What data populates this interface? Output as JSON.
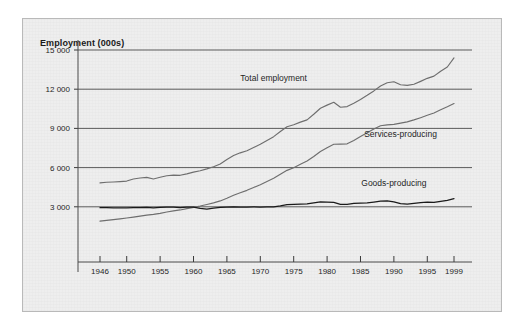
{
  "figure": {
    "title": "Employment (000s)",
    "background_color": "#eeeeee",
    "border_color": "#b9b9b9"
  },
  "chart_data": {
    "type": "line",
    "title": "Employment (000s)",
    "xlabel": "",
    "ylabel": "Employment (000s)",
    "grid": true,
    "legend_position": "inline-annotations",
    "xlim": [
      1946,
      1999
    ],
    "ylim": [
      0,
      15000
    ],
    "x_tick_labels": [
      "1946",
      "1950",
      "1955",
      "1960",
      "1965",
      "1970",
      "1975",
      "1980",
      "1985",
      "1990",
      "1995",
      "1999"
    ],
    "x_ticks": [
      1946,
      1950,
      1955,
      1960,
      1965,
      1970,
      1975,
      1980,
      1985,
      1990,
      1995,
      1999
    ],
    "y_tick_labels": [
      "3 000",
      "6 000",
      "9 000",
      "12 000",
      "15 000"
    ],
    "y_ticks": [
      3000,
      6000,
      9000,
      12000,
      15000
    ],
    "x": [
      1946,
      1947,
      1948,
      1949,
      1950,
      1951,
      1952,
      1953,
      1954,
      1955,
      1956,
      1957,
      1958,
      1959,
      1960,
      1961,
      1962,
      1963,
      1964,
      1965,
      1966,
      1967,
      1968,
      1969,
      1970,
      1971,
      1972,
      1973,
      1974,
      1975,
      1976,
      1977,
      1978,
      1979,
      1980,
      1981,
      1982,
      1983,
      1984,
      1985,
      1986,
      1987,
      1988,
      1989,
      1990,
      1991,
      1992,
      1993,
      1994,
      1995,
      1996,
      1997,
      1998,
      1999
    ],
    "series": [
      {
        "name": "Total employment",
        "color": "#6e6e6e",
        "label_x": 1972,
        "label_y": 12650,
        "values": [
          4830,
          4880,
          4900,
          4930,
          4970,
          5130,
          5200,
          5250,
          5130,
          5260,
          5380,
          5420,
          5410,
          5520,
          5650,
          5760,
          5900,
          6060,
          6280,
          6620,
          6920,
          7130,
          7290,
          7540,
          7790,
          8080,
          8370,
          8760,
          9130,
          9280,
          9480,
          9650,
          10080,
          10540,
          10780,
          11000,
          10620,
          10670,
          10930,
          11220,
          11530,
          11870,
          12250,
          12490,
          12570,
          12340,
          12290,
          12380,
          12600,
          12830,
          13000,
          13380,
          13700,
          14400
        ]
      },
      {
        "name": "Services-producing",
        "color": "#6e6e6e",
        "label_x": 1991,
        "label_y": 8350,
        "values": [
          1900,
          1960,
          2020,
          2080,
          2140,
          2210,
          2290,
          2360,
          2420,
          2500,
          2600,
          2690,
          2760,
          2860,
          2960,
          3060,
          3180,
          3300,
          3450,
          3650,
          3880,
          4080,
          4260,
          4480,
          4690,
          4930,
          5180,
          5490,
          5790,
          5990,
          6250,
          6500,
          6850,
          7230,
          7520,
          7790,
          7800,
          7820,
          8080,
          8380,
          8660,
          8960,
          9200,
          9270,
          9310,
          9400,
          9500,
          9650,
          9820,
          10000,
          10180,
          10420,
          10650,
          10900
        ]
      },
      {
        "name": "Goods-producing",
        "color": "#1a1a1a",
        "label_x": 1990,
        "label_y": 4600,
        "values": [
          2930,
          2930,
          2920,
          2910,
          2910,
          2930,
          2940,
          2950,
          2920,
          2950,
          2980,
          2980,
          2940,
          2970,
          2980,
          2880,
          2820,
          2890,
          2950,
          2980,
          2990,
          2980,
          2970,
          2990,
          2980,
          2990,
          3000,
          3070,
          3160,
          3180,
          3200,
          3220,
          3300,
          3380,
          3360,
          3340,
          3180,
          3180,
          3260,
          3290,
          3300,
          3360,
          3430,
          3450,
          3370,
          3240,
          3200,
          3260,
          3320,
          3350,
          3330,
          3420,
          3500,
          3620
        ]
      }
    ]
  }
}
